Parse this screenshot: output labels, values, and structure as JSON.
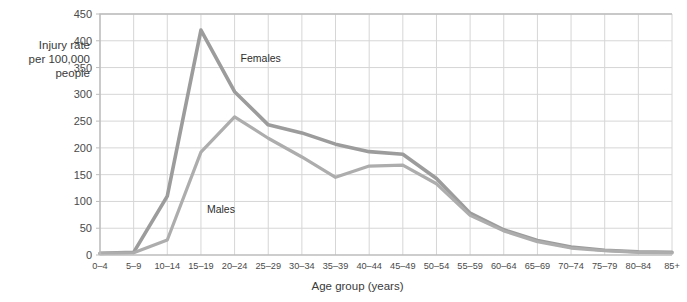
{
  "chart_data": {
    "type": "line",
    "title": "",
    "xlabel": "Age group (years)",
    "ylabel": "Injury rate\nper 100,000\npeople",
    "categories": [
      "0–4",
      "5–9",
      "10–14",
      "15–19",
      "20–24",
      "25–29",
      "30–34",
      "35–39",
      "40–44",
      "45–49",
      "50–54",
      "55–59",
      "60–64",
      "65–69",
      "70–74",
      "75–79",
      "80–84",
      "85+"
    ],
    "ylim": [
      0,
      450
    ],
    "yticks": [
      0,
      50,
      100,
      150,
      200,
      250,
      300,
      350,
      400,
      450
    ],
    "grid": true,
    "legend_position": "inline-annotations",
    "series": [
      {
        "name": "Females",
        "color": "#9c9c9c",
        "values": [
          3,
          5,
          110,
          420,
          305,
          243,
          228,
          207,
          193,
          188,
          143,
          78,
          47,
          27,
          15,
          9,
          6,
          5
        ]
      },
      {
        "name": "Males",
        "color": "#adadad",
        "values": [
          3,
          4,
          28,
          192,
          258,
          218,
          183,
          145,
          166,
          168,
          133,
          74,
          45,
          25,
          13,
          8,
          5,
          4
        ]
      }
    ],
    "annotations": [
      {
        "text": "Females",
        "category": "20–24",
        "value": 360
      },
      {
        "text": "Males",
        "category": "15–19",
        "value": 78
      }
    ]
  }
}
